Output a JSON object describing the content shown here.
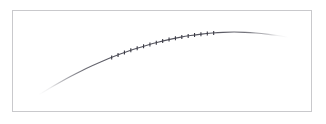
{
  "figure": {
    "width": 326,
    "height": 124,
    "background_color": "#ffffff",
    "frame": {
      "x": 12,
      "y": 10,
      "width": 300,
      "height": 102,
      "border_color": "#c9c9cc",
      "border_width": 1,
      "fill_color": "#ffffff"
    }
  },
  "chart_data": {
    "type": "line",
    "title": "",
    "subtitle": "",
    "xlabel": "",
    "ylabel": "",
    "grid": false,
    "legend": null,
    "legend_position": "none",
    "axes_visible": false,
    "tick_labels_x": [],
    "tick_labels_y": [],
    "xlim": [
      0,
      1
    ],
    "ylim": [
      0,
      1
    ],
    "series": [
      {
        "name": "curve",
        "style": "smooth-arch",
        "line_color": "#55555f",
        "line_width": 1.1,
        "fade_ends": true,
        "marker": "tick",
        "marker_color": "#3a3a44",
        "marker_size": 4,
        "x": [
          0.045,
          0.085,
          0.125,
          0.165,
          0.205,
          0.245,
          0.285,
          0.325,
          0.365,
          0.405,
          0.445,
          0.485,
          0.525,
          0.565,
          0.605,
          0.645,
          0.685,
          0.725,
          0.765,
          0.805,
          0.845,
          0.885,
          0.925,
          0.965
        ],
        "y": [
          0.045,
          0.145,
          0.24,
          0.33,
          0.414,
          0.492,
          0.565,
          0.632,
          0.694,
          0.75,
          0.8,
          0.845,
          0.884,
          0.918,
          0.946,
          0.968,
          0.984,
          0.995,
          1.0,
          0.995,
          0.984,
          0.968,
          0.946,
          0.918
        ]
      }
    ],
    "markers": {
      "count": 17,
      "x_start": 0.315,
      "x_end": 0.69,
      "shape": "vertical-tick",
      "color": "#3a3a44"
    },
    "annotations": []
  }
}
